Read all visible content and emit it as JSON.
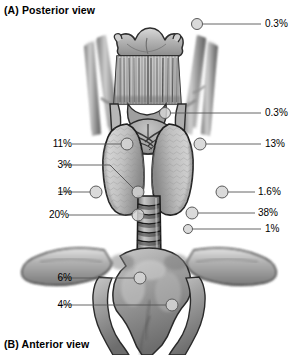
{
  "figure": {
    "caption_top": "(A) Posterior view",
    "caption_bottom": "(B) Anterior view",
    "colors": {
      "line": "#555555",
      "marker_fill": "#d4d4d4",
      "marker_stroke": "#5a5a5a",
      "text": "#000000",
      "background": "#ffffff"
    }
  },
  "callouts": [
    {
      "id": "c1",
      "value": "0.3%",
      "side": "right",
      "text_x": 265,
      "text_y": 19,
      "marker_x": 197,
      "marker_y": 24,
      "marker_r": 5.5,
      "path": "M 202.5 24 L 261 24"
    },
    {
      "id": "c2",
      "value": "0.3%",
      "side": "right",
      "text_x": 265,
      "text_y": 108,
      "marker_x": 165,
      "marker_y": 113,
      "marker_r": 5.5,
      "path": "M 170.5 113 L 261 113"
    },
    {
      "id": "c3",
      "value": "11%",
      "side": "left",
      "text_x": 36,
      "text_y": 139,
      "marker_x": 127,
      "marker_y": 144,
      "marker_r": 6,
      "path": "M 72 144 L 121 144"
    },
    {
      "id": "c4",
      "value": "13%",
      "side": "right",
      "text_x": 265,
      "text_y": 139,
      "marker_x": 200,
      "marker_y": 144,
      "marker_r": 6,
      "path": "M 206 144 L 261 144"
    },
    {
      "id": "c5",
      "value": "3%",
      "side": "left",
      "text_x": 36,
      "text_y": 160,
      "marker_x": 138,
      "marker_y": 192,
      "marker_r": 6,
      "path": "M 62 165 L 110 165 L 134 189"
    },
    {
      "id": "c6",
      "value": "1%",
      "side": "left",
      "text_x": 36,
      "text_y": 187,
      "marker_x": 96,
      "marker_y": 192,
      "marker_r": 6,
      "path": "M 58 192 L 90 192"
    },
    {
      "id": "c7",
      "value": "1.6%",
      "side": "right",
      "text_x": 258,
      "text_y": 187,
      "marker_x": 222,
      "marker_y": 192,
      "marker_r": 6,
      "path": "M 228 192 L 255 192"
    },
    {
      "id": "c8",
      "value": "20%",
      "side": "left",
      "text_x": 33,
      "text_y": 210,
      "marker_x": 138,
      "marker_y": 215,
      "marker_r": 6,
      "path": "M 68 215 L 132 215"
    },
    {
      "id": "c9",
      "value": "38%",
      "side": "right",
      "text_x": 258,
      "text_y": 208,
      "marker_x": 192,
      "marker_y": 213,
      "marker_r": 6,
      "path": "M 198 213 L 255 213"
    },
    {
      "id": "c10",
      "value": "1%",
      "side": "right",
      "text_x": 265,
      "text_y": 224,
      "marker_x": 188,
      "marker_y": 229,
      "marker_r": 4.5,
      "path": "M 192.5 229 L 261 229"
    },
    {
      "id": "c11",
      "value": "6%",
      "side": "left",
      "text_x": 36,
      "text_y": 273,
      "marker_x": 140,
      "marker_y": 278,
      "marker_r": 6,
      "path": "M 58 278 L 134 278"
    },
    {
      "id": "c12",
      "value": "4%",
      "side": "left",
      "text_x": 36,
      "text_y": 300,
      "marker_x": 172,
      "marker_y": 305,
      "marker_r": 6,
      "path": "M 58 305 L 166 305"
    }
  ]
}
